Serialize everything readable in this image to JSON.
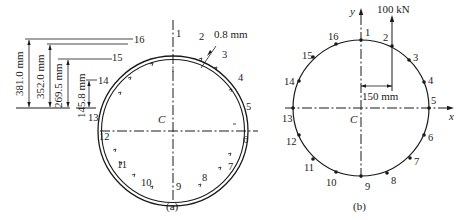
{
  "figure_a": {
    "caption": "(a)",
    "centroid_label": "C",
    "thickness_label": "0.8 mm",
    "dimensions": [
      {
        "label": "381.0 mm",
        "ref_node": "16"
      },
      {
        "label": "352.0 mm",
        "ref_node": "15"
      },
      {
        "label": "269.5 mm",
        "ref_node": "15"
      },
      {
        "label": "145.8 mm",
        "ref_node": "14"
      }
    ],
    "nodes": [
      "1",
      "2",
      "3",
      "4",
      "5",
      "6",
      "7",
      "8",
      "9",
      "10",
      "11",
      "12",
      "13",
      "14",
      "15",
      "16"
    ]
  },
  "figure_b": {
    "caption": "(b)",
    "centroid_label": "C",
    "x_axis_label": "x",
    "y_axis_label": "y",
    "load_label": "100 kN",
    "offset_label": "150 mm",
    "nodes": [
      "1",
      "2",
      "3",
      "4",
      "5",
      "6",
      "7",
      "8",
      "9",
      "10",
      "11",
      "12",
      "13",
      "14",
      "15",
      "16"
    ]
  }
}
